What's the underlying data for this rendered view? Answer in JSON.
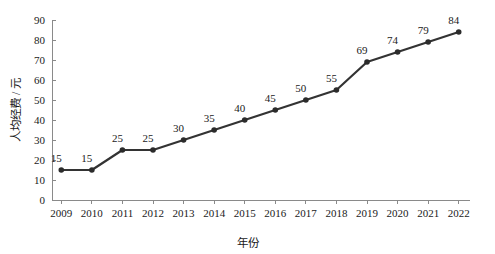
{
  "chart_data": {
    "type": "line",
    "title": "",
    "subtitle": "",
    "xlabel": "年份",
    "ylabel": "人均经费 / 元",
    "categories": [
      "2009",
      "2010",
      "2011",
      "2012",
      "2013",
      "2014",
      "2015",
      "2016",
      "2017",
      "2018",
      "2019",
      "2020",
      "2021",
      "2022"
    ],
    "values": [
      15,
      15,
      25,
      25,
      30,
      35,
      40,
      45,
      50,
      55,
      69,
      74,
      79,
      84
    ],
    "point_labels": [
      "15",
      "15",
      "25",
      "25",
      "30",
      "35",
      "40",
      "45",
      "50",
      "55",
      "69",
      "74",
      "79",
      "84"
    ],
    "series": [
      {
        "name": "人均经费",
        "values": [
          15,
          15,
          25,
          25,
          30,
          35,
          40,
          45,
          50,
          55,
          69,
          74,
          79,
          84
        ]
      }
    ],
    "ylim": [
      0,
      90
    ],
    "ytick_step": 10,
    "yticks": [
      0,
      10,
      20,
      30,
      40,
      50,
      60,
      70,
      80,
      90
    ],
    "ytick_labels": [
      "0",
      "10",
      "20",
      "30",
      "40",
      "50",
      "60",
      "70",
      "80",
      "90"
    ],
    "xticks": [
      "2009",
      "2010",
      "2011",
      "2012",
      "2013",
      "2014",
      "2015",
      "2016",
      "2017",
      "2018",
      "2019",
      "2020",
      "2021",
      "2022"
    ],
    "grid": false,
    "legend": false,
    "legend_position": "none",
    "show_markers": true,
    "show_point_labels": true,
    "line_color": "#333333",
    "marker_color": "#2b2b2b",
    "axis_color": "#8a8a8a",
    "text_color": "#1a1a1a",
    "background_color": "#ffffff",
    "annotations": []
  }
}
